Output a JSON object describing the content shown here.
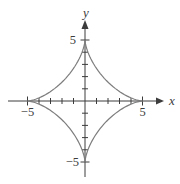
{
  "figure": {
    "background": "#ffffff"
  },
  "chart_data": {
    "type": "line",
    "curve": "astroid",
    "equation": "x^(2/3) + y^(2/3) = 5^(2/3)",
    "parametric": {
      "x": "a*cos(t)^3",
      "y": "a*sin(t)^3",
      "a": 5
    },
    "cusps": [
      [
        5,
        0
      ],
      [
        0,
        5
      ],
      [
        -5,
        0
      ],
      [
        0,
        -5
      ]
    ],
    "xlabel": "x",
    "ylabel": "y",
    "xlim": [
      -6.7,
      6.9
    ],
    "ylim": [
      -6.2,
      6.7
    ],
    "grid": false,
    "legend": null,
    "x_axis": {
      "ticks": [
        -5,
        -4,
        -3,
        -2,
        -1,
        1,
        2,
        3,
        4,
        5
      ],
      "labeled_ticks": [
        {
          "value": -5,
          "label": "−5"
        },
        {
          "value": 5,
          "label": "5"
        }
      ]
    },
    "y_axis": {
      "ticks": [
        -5,
        -4,
        -3,
        -2,
        -1,
        1,
        2,
        3,
        4,
        5
      ],
      "labeled_ticks": [
        {
          "value": 5,
          "label": "5"
        },
        {
          "value": -5,
          "label": "−5"
        }
      ]
    },
    "colors": {
      "axis": "#3c3c3c",
      "curve": "#7d7d7d",
      "label": "#3c3c3c"
    }
  }
}
